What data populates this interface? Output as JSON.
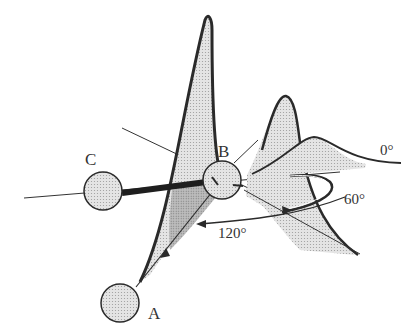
{
  "diagram": {
    "type": "molecular-orbital-rotation",
    "atoms": [
      {
        "id": "A",
        "label": "A"
      },
      {
        "id": "B",
        "label": "B"
      },
      {
        "id": "C",
        "label": "C"
      }
    ],
    "angles": [
      {
        "label": "0°"
      },
      {
        "label": "60°"
      },
      {
        "label": "120°"
      }
    ],
    "colors": {
      "stroke": "#2a2a2a",
      "fill_light": "#e6e6e6",
      "fill_mid": "#cfcfcf",
      "fill_dark": "#a9a9a9",
      "sphere": "#e9e9e9"
    }
  }
}
